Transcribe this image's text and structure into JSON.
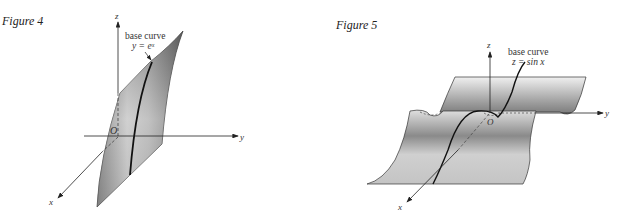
{
  "figures": [
    {
      "title": "Figure 4",
      "axes": {
        "x": "x",
        "y": "y",
        "z": "z",
        "origin": "O"
      },
      "annotation": {
        "line1": "base curve",
        "line2": "y = eˣ"
      }
    },
    {
      "title": "Figure 5",
      "axes": {
        "x": "x",
        "y": "y",
        "z": "z",
        "origin": "O"
      },
      "annotation": {
        "line1": "base curve",
        "line2": "z = sin x"
      }
    }
  ]
}
